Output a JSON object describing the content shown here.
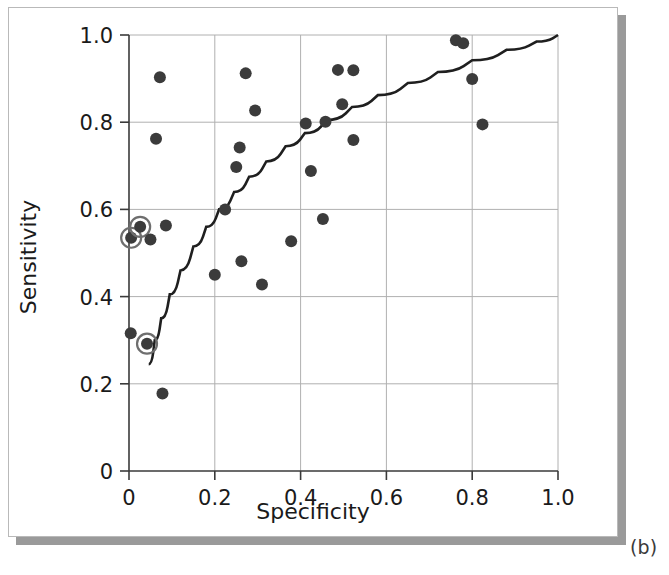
{
  "figure": {
    "caption": "(b)",
    "panel_background": "#ffffff",
    "shadow_color": "#9a9a9a",
    "border_color": "#b9b9b9"
  },
  "chart_data": {
    "type": "scatter",
    "title": "",
    "xlabel": "Specificity",
    "ylabel": "Sensitivity",
    "xlim": [
      0.0,
      1.0
    ],
    "ylim": [
      0.0,
      1.0
    ],
    "grid": true,
    "legend": null,
    "xticks": [
      0,
      0.2,
      0.4,
      0.6,
      0.8,
      1.0
    ],
    "xtick_labels": [
      "0",
      "0.2",
      "0.4",
      "0.6",
      "0.8",
      "1.0"
    ],
    "yticks": [
      0,
      0.2,
      0.4,
      0.6,
      0.8,
      1.0
    ],
    "ytick_labels": [
      "0",
      "0.2",
      "0.4",
      "0.6",
      "0.8",
      "1.0"
    ],
    "marker_color": "#3b3b3b",
    "marker_radius_px": 6,
    "highlight_ring_color": "#6e6e6e",
    "curve_color": "#1f1f1f",
    "points": [
      {
        "x": 0.005,
        "y": 0.535,
        "highlighted": true
      },
      {
        "x": 0.026,
        "y": 0.56,
        "highlighted": true
      },
      {
        "x": 0.042,
        "y": 0.292,
        "highlighted": true
      },
      {
        "x": 0.004,
        "y": 0.316,
        "highlighted": false
      },
      {
        "x": 0.05,
        "y": 0.531,
        "highlighted": false
      },
      {
        "x": 0.072,
        "y": 0.903,
        "highlighted": false
      },
      {
        "x": 0.063,
        "y": 0.762,
        "highlighted": false
      },
      {
        "x": 0.086,
        "y": 0.563,
        "highlighted": false
      },
      {
        "x": 0.078,
        "y": 0.178,
        "highlighted": false
      },
      {
        "x": 0.2,
        "y": 0.45,
        "highlighted": false
      },
      {
        "x": 0.224,
        "y": 0.6,
        "highlighted": false
      },
      {
        "x": 0.25,
        "y": 0.697,
        "highlighted": false
      },
      {
        "x": 0.258,
        "y": 0.742,
        "highlighted": false
      },
      {
        "x": 0.262,
        "y": 0.481,
        "highlighted": false
      },
      {
        "x": 0.272,
        "y": 0.912,
        "highlighted": false
      },
      {
        "x": 0.294,
        "y": 0.827,
        "highlighted": false
      },
      {
        "x": 0.31,
        "y": 0.428,
        "highlighted": false
      },
      {
        "x": 0.378,
        "y": 0.527,
        "highlighted": false
      },
      {
        "x": 0.412,
        "y": 0.797,
        "highlighted": false
      },
      {
        "x": 0.424,
        "y": 0.688,
        "highlighted": false
      },
      {
        "x": 0.452,
        "y": 0.578,
        "highlighted": false
      },
      {
        "x": 0.458,
        "y": 0.801,
        "highlighted": false
      },
      {
        "x": 0.487,
        "y": 0.92,
        "highlighted": false
      },
      {
        "x": 0.497,
        "y": 0.841,
        "highlighted": false
      },
      {
        "x": 0.523,
        "y": 0.919,
        "highlighted": false
      },
      {
        "x": 0.523,
        "y": 0.759,
        "highlighted": false
      },
      {
        "x": 0.762,
        "y": 0.988,
        "highlighted": false
      },
      {
        "x": 0.779,
        "y": 0.981,
        "highlighted": false
      },
      {
        "x": 0.8,
        "y": 0.899,
        "highlighted": false
      },
      {
        "x": 0.824,
        "y": 0.795,
        "highlighted": false
      }
    ],
    "curve": {
      "name": "sroc-fitted-curve",
      "points": [
        {
          "x": 0.046,
          "y": 0.245
        },
        {
          "x": 0.06,
          "y": 0.3
        },
        {
          "x": 0.075,
          "y": 0.35
        },
        {
          "x": 0.095,
          "y": 0.405
        },
        {
          "x": 0.12,
          "y": 0.46
        },
        {
          "x": 0.15,
          "y": 0.515
        },
        {
          "x": 0.18,
          "y": 0.56
        },
        {
          "x": 0.21,
          "y": 0.6
        },
        {
          "x": 0.245,
          "y": 0.64
        },
        {
          "x": 0.28,
          "y": 0.675
        },
        {
          "x": 0.32,
          "y": 0.71
        },
        {
          "x": 0.365,
          "y": 0.745
        },
        {
          "x": 0.41,
          "y": 0.775
        },
        {
          "x": 0.46,
          "y": 0.805
        },
        {
          "x": 0.52,
          "y": 0.835
        },
        {
          "x": 0.58,
          "y": 0.862
        },
        {
          "x": 0.65,
          "y": 0.89
        },
        {
          "x": 0.72,
          "y": 0.915
        },
        {
          "x": 0.8,
          "y": 0.942
        },
        {
          "x": 0.88,
          "y": 0.966
        },
        {
          "x": 0.95,
          "y": 0.985
        },
        {
          "x": 1.0,
          "y": 1.0
        }
      ]
    }
  }
}
